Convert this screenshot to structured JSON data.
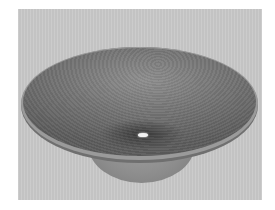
{
  "image": {
    "subject": "vessel bowl sink",
    "description": "Round wooden/stone-textured vessel sink with a wide flared rim, a narrower base, and a small central drain, on a light gray background",
    "colors": {
      "background": "#c9c9c9",
      "bowl_inner": "#747474",
      "rim_lip": "#9a9a9a",
      "base": "#8c8c8c",
      "drain": "#f2f2f2"
    }
  }
}
